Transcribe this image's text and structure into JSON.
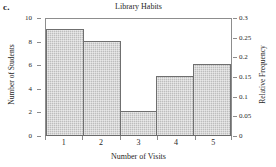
{
  "part_label": "c.",
  "chart_data": {
    "type": "bar",
    "title": "Library Habits",
    "xlabel": "Number of Visits",
    "ylabel": "Number of Students",
    "y2label": "Relative Frequency",
    "categories": [
      "1",
      "2",
      "3",
      "4",
      "5"
    ],
    "values": [
      9,
      8,
      2,
      5,
      6
    ],
    "relative_frequency": [
      0.3,
      0.2667,
      0.0667,
      0.1667,
      0.2
    ],
    "ylim": [
      0,
      10
    ],
    "y2lim": [
      0,
      0.3
    ],
    "yticks": [
      0,
      2,
      4,
      6,
      8,
      10
    ],
    "ytick_labels": [
      "0",
      "2",
      "4",
      "6",
      "8",
      "10"
    ],
    "y2ticks": [
      0,
      0.05,
      0.1,
      0.15,
      0.2,
      0.25,
      0.3
    ],
    "y2tick_labels": [
      "0",
      "0.05",
      "0.1",
      "0.15",
      "0.2",
      "0.25",
      "0.3"
    ],
    "xtick_labels": [
      "1",
      "2",
      "3",
      "4",
      "5"
    ],
    "grid": false,
    "legend": false,
    "bar_fill_color": "#bdbdbd",
    "bar_edge_color": "#6f6f6f",
    "axis_color": "#8d8d8d",
    "total_students": 30
  }
}
